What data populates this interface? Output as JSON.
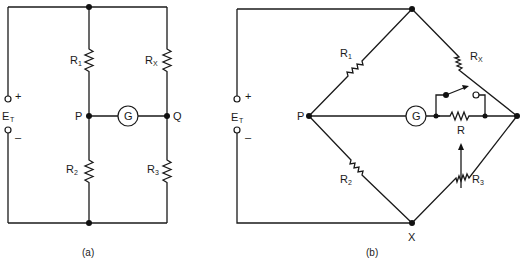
{
  "figure": {
    "colors": {
      "line": "#1a1a1a",
      "background": "#ffffff"
    }
  },
  "diagram_a": {
    "caption": "(a)",
    "source": {
      "name": "E",
      "subscript": "T",
      "plus": "+",
      "minus": "–"
    },
    "resistors": [
      {
        "name": "R",
        "subscript": "1"
      },
      {
        "name": "R",
        "subscript": "X"
      },
      {
        "name": "R",
        "subscript": "2"
      },
      {
        "name": "R",
        "subscript": "3"
      }
    ],
    "galvanometer": "G",
    "nodes": {
      "left": "P",
      "right": "Q"
    }
  },
  "diagram_b": {
    "caption": "(b)",
    "source": {
      "name": "E",
      "subscript": "T",
      "plus": "+",
      "minus": "–"
    },
    "resistors": [
      {
        "name": "R",
        "subscript": "1"
      },
      {
        "name": "R",
        "subscript": "X"
      },
      {
        "name": "R",
        "subscript": "2"
      },
      {
        "name": "R",
        "subscript": "3",
        "variable": true
      }
    ],
    "shunt_resistor": "R",
    "galvanometer": "G",
    "nodes": {
      "left": "P",
      "bottom": "X"
    }
  }
}
